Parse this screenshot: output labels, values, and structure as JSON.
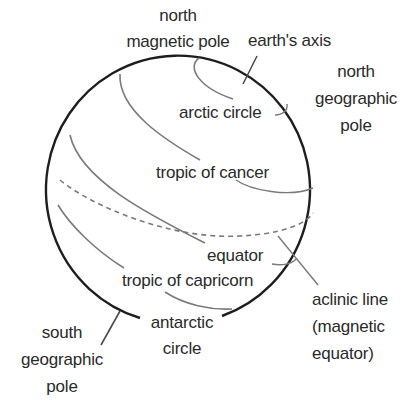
{
  "diagram": {
    "colors": {
      "outline": "#1e1e1e",
      "guide_lines": "#7a7a7a",
      "label_text": "#2a2a2a",
      "background": "#ffffff"
    },
    "labels": {
      "north_magnetic_pole": [
        "north",
        "magnetic pole"
      ],
      "earths_axis": "earth's axis",
      "north_geographic_pole": [
        "north",
        "geographic",
        "pole"
      ],
      "arctic_circle": "arctic circle",
      "tropic_of_cancer": "tropic of cancer",
      "equator": "equator",
      "tropic_of_capricorn": "tropic of capricorn",
      "aclinic_line": [
        "aclinic line",
        "(magnetic",
        "equator)"
      ],
      "antarctic_circle": [
        "antarctic",
        "circle"
      ],
      "south_geographic_pole": [
        "south",
        "geographic",
        "pole"
      ]
    }
  }
}
